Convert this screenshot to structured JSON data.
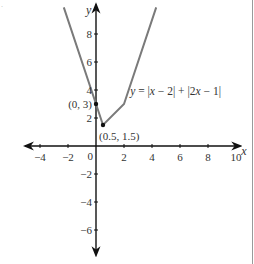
{
  "chart_data": {
    "type": "line",
    "title": "",
    "xlabel": "x",
    "ylabel": "y",
    "xlim": [
      -5,
      10.3
    ],
    "ylim": [
      -7.8,
      10.1
    ],
    "xticks": [
      -4,
      -2,
      2,
      4,
      6,
      8,
      10
    ],
    "xtick_labels": [
      "−4",
      "−2",
      "2",
      "4",
      "6",
      "8",
      "10"
    ],
    "yticks": [
      8,
      6,
      4,
      2,
      -2,
      -4,
      -6
    ],
    "ytick_labels": [
      "8",
      "6",
      "4",
      "2",
      "−2",
      "−4",
      "−6"
    ],
    "origin_label": "0",
    "grid": false,
    "series": [
      {
        "name": "y = |x − 2| + |2x − 1|",
        "x": [
          -2.3,
          0.5,
          2,
          4.3
        ],
        "y": [
          9.9,
          1.5,
          3,
          9.9
        ],
        "color": "#7a7a7a"
      }
    ],
    "points": [
      {
        "x": 0,
        "y": 3,
        "label": "(0, 3)"
      },
      {
        "x": 0.5,
        "y": 1.5,
        "label": "(0.5, 1.5)"
      }
    ],
    "equation_label": {
      "parts": [
        "y",
        " = |",
        "x",
        " − 2| + |2",
        "x",
        " − 1|"
      ],
      "anchor": {
        "x": 2.3,
        "y": 3.9
      }
    }
  },
  "corner_mark": "."
}
